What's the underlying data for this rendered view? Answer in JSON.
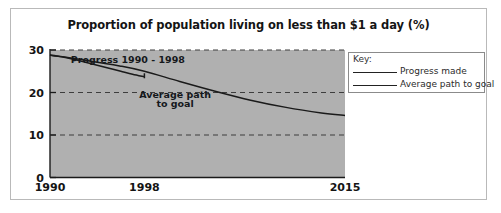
{
  "chart_data": {
    "type": "line",
    "title": "Proportion of population living on less than $1 a day (%)",
    "xlabel": "",
    "ylabel": "",
    "xlim": [
      1990,
      2015
    ],
    "ylim": [
      0,
      30
    ],
    "yticks": [
      0,
      10,
      20,
      30
    ],
    "ytick_labels": [
      "0",
      "10",
      "20",
      "30"
    ],
    "xticks": [
      1990,
      1998,
      2015
    ],
    "xtick_labels": [
      "1990",
      "1998",
      "2015"
    ],
    "grid": "horizontal dashed gridlines at 10 and 20",
    "legend_position": "outside right, top",
    "plot_background": "#b0b0b0",
    "line_color": "#1a1a1a",
    "series": [
      {
        "name": "Progress made",
        "x": [
          1990,
          1991,
          1992,
          1993,
          1994,
          1995,
          1996,
          1997,
          1998
        ],
        "values": [
          28.8,
          28.4,
          27.8,
          27.1,
          26.4,
          25.7,
          25.0,
          24.3,
          23.7
        ]
      },
      {
        "name": "Average path to goal",
        "x": [
          1990,
          1993,
          1996,
          1998,
          2001,
          2004,
          2007,
          2010,
          2013,
          2015
        ],
        "values": [
          28.8,
          27.6,
          26.2,
          25.0,
          22.6,
          20.3,
          18.2,
          16.5,
          15.2,
          14.6
        ]
      }
    ],
    "annotations": [
      {
        "text": "Progress 1990 - 1998",
        "x": 1996.6,
        "y": 27.0
      },
      {
        "text": "Average path",
        "x": 2000.6,
        "y": 18.6
      },
      {
        "text": "to goal",
        "x": 2000.6,
        "y": 16.5
      }
    ]
  },
  "legend": {
    "key_label": "Key:",
    "entries": [
      {
        "label": "Progress made"
      },
      {
        "label": "Average path to goal"
      }
    ]
  }
}
